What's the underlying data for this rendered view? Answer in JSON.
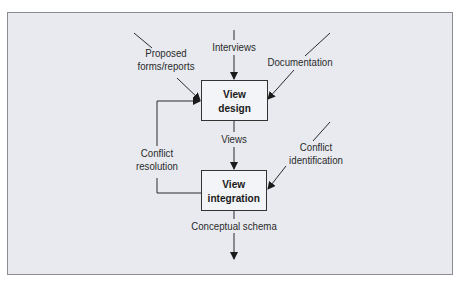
{
  "diagram": {
    "nodes": {
      "view_design": {
        "line1": "View",
        "line2": "design"
      },
      "view_integration": {
        "line1": "View",
        "line2": "integration"
      }
    },
    "inputs": {
      "proposed_line1": "Proposed",
      "proposed_line2": "forms/reports",
      "interviews": "Interviews",
      "documentation": "Documentation"
    },
    "edges": {
      "views": "Views",
      "conflict_resolution_line1": "Conflict",
      "conflict_resolution_line2": "resolution",
      "conflict_identification_line1": "Conflict",
      "conflict_identification_line2": "identification",
      "output": "Conceptual schema"
    },
    "colors": {
      "background": "#e8eaf0",
      "line": "#2a2a2a",
      "box_fill": "#f3f4f7"
    }
  }
}
